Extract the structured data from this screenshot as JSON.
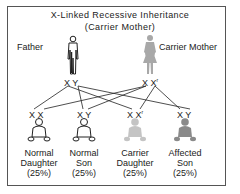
{
  "title": "X-Linked Recessive Inheritance",
  "subtitle": "(Carrier Mother)",
  "colors": {
    "normal": "#222222",
    "carrier": "#b5b5b5",
    "affected": "#8a8a8a",
    "carrier_mother": "#a8a8a8",
    "border": "#555555"
  },
  "parents": {
    "father": {
      "label": "Father",
      "alleles": [
        "X",
        "Y"
      ],
      "icon": "male-figure-icon"
    },
    "mother": {
      "label": "Carrier Mother",
      "alleles": [
        "X",
        "X"
      ],
      "mutant_mark": "r",
      "icon": "female-figure-icon"
    }
  },
  "children": [
    {
      "line1": "Normal",
      "line2": "Daughter",
      "pct": "(25%)",
      "alleles": [
        "X",
        "X"
      ],
      "mutant": false,
      "status": "normal"
    },
    {
      "line1": "Normal",
      "line2": "Son",
      "pct": "(25%)",
      "alleles": [
        "X",
        "Y"
      ],
      "mutant": false,
      "status": "normal"
    },
    {
      "line1": "Carrier",
      "line2": "Daughter",
      "pct": "(25%)",
      "alleles": [
        "X",
        "X"
      ],
      "mutant": true,
      "status": "carrier"
    },
    {
      "line1": "Affected",
      "line2": "Son",
      "pct": "(25%)",
      "alleles": [
        "X",
        "Y"
      ],
      "mutant": false,
      "status": "affected"
    }
  ],
  "mutant_mark": "r"
}
